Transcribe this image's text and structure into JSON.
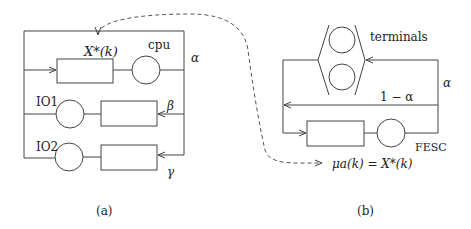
{
  "diagram_a": {
    "caption": "(a)",
    "queue_label": "X*(k)",
    "cpu_label": "cpu",
    "io1_label": "IO1",
    "io2_label": "IO2",
    "alpha_label": "α",
    "beta_label": "β",
    "gamma_label": "γ"
  },
  "diagram_b": {
    "caption": "(b)",
    "terminals_label": "terminals",
    "alpha_label": "α",
    "one_minus_alpha_label": "1 − α",
    "fesc_label": "FESC",
    "service_rate_label": "μa(k) = X*(k)"
  },
  "colors": {
    "line": "#444444",
    "text": "#222222",
    "background": "#ffffff"
  }
}
